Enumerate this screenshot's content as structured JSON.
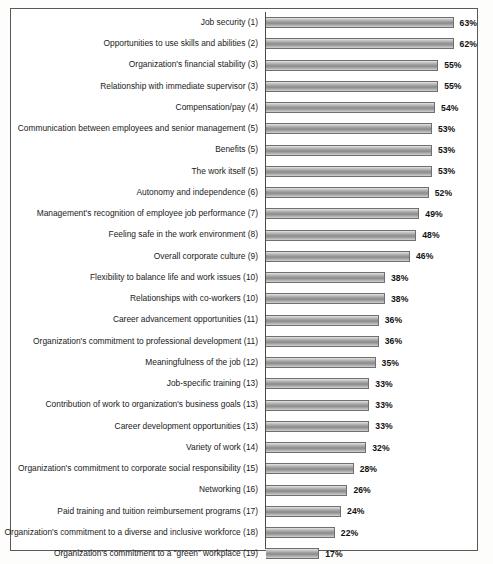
{
  "figure": {
    "frame_color": "#58585a",
    "background": "#ffffff",
    "bar_fill_dark": "#8b8b8b",
    "bar_fill_light": "#e6e6e6",
    "bar_outline": "#6f6f6f",
    "label_color": "#1a1a1a"
  },
  "chart_data": {
    "type": "bar",
    "orientation": "horizontal",
    "title": "",
    "subtitle": "",
    "xlabel": "",
    "ylabel": "",
    "xlim": [
      0,
      63
    ],
    "grid": false,
    "legend": false,
    "value_suffix": "%",
    "categories": [
      "Job security (1)",
      "Opportunities to use skills and abilities (2)",
      "Organization's financial stability (3)",
      "Relationship with immediate supervisor (3)",
      "Compensation/pay (4)",
      "Communication between employees and senior management (5)",
      "Benefits (5)",
      "The work itself (5)",
      "Autonomy and independence (6)",
      "Management's recognition of employee job performance (7)",
      "Feeling safe in the work environment (8)",
      "Overall corporate culture (9)",
      "Flexibility to balance life and work issues (10)",
      "Relationships with co-workers (10)",
      "Career advancement opportunities (11)",
      "Organization's commitment to professional development (11)",
      "Meaningfulness of the job (12)",
      "Job-specific training (13)",
      "Contribution of work to organization's business goals (13)",
      "Career development opportunities (13)",
      "Variety of work (14)",
      "Organization's commitment to corporate social responsibility (15)",
      "Networking (16)",
      "Paid training and tuition reimbursement programs (17)",
      "Organization's commitment to a diverse and inclusive workforce (18)",
      "Organization's commitment to a “green” workplace (19)"
    ],
    "values": [
      63,
      62,
      55,
      55,
      54,
      53,
      53,
      53,
      52,
      49,
      48,
      46,
      38,
      38,
      36,
      36,
      35,
      33,
      33,
      33,
      32,
      28,
      26,
      24,
      22,
      17
    ],
    "value_labels": [
      "63%",
      "62%",
      "55%",
      "55%",
      "54%",
      "53%",
      "53%",
      "53%",
      "52%",
      "49%",
      "48%",
      "46%",
      "38%",
      "38%",
      "36%",
      "36%",
      "35%",
      "33%",
      "33%",
      "33%",
      "32%",
      "28%",
      "26%",
      "24%",
      "22%",
      "17%"
    ]
  }
}
